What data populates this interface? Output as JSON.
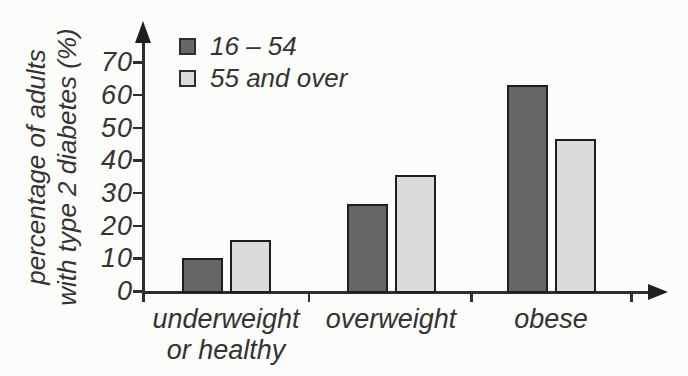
{
  "chart_data": {
    "type": "bar",
    "title": "",
    "ylabel": "percentage of adults with type 2 diabetes (%)",
    "ylabel_lines": [
      "percentage of adults",
      "with type 2 diabetes (%)"
    ],
    "xlabel": "",
    "ylim": [
      0,
      75
    ],
    "yticks": [
      0,
      10,
      20,
      30,
      40,
      50,
      60,
      70
    ],
    "grid": false,
    "legend_position": "top-left-inside",
    "categories": [
      {
        "label": "underweight or healthy",
        "lines": [
          "underweight",
          "or healthy"
        ]
      },
      {
        "label": "overweight",
        "lines": [
          "overweight"
        ]
      },
      {
        "label": "obese",
        "lines": [
          "obese"
        ]
      }
    ],
    "series": [
      {
        "name": "16 – 54",
        "color": "#666666",
        "values": [
          10,
          26.5,
          63
        ]
      },
      {
        "name": "55 and over",
        "color": "#dbdbdb",
        "values": [
          15.5,
          35.5,
          46.5
        ]
      }
    ],
    "axis_color": "#2e2e2e",
    "text_color": "#333333",
    "bar_border_color": "#1e1e1e",
    "background_color": "#fcfcfa"
  }
}
